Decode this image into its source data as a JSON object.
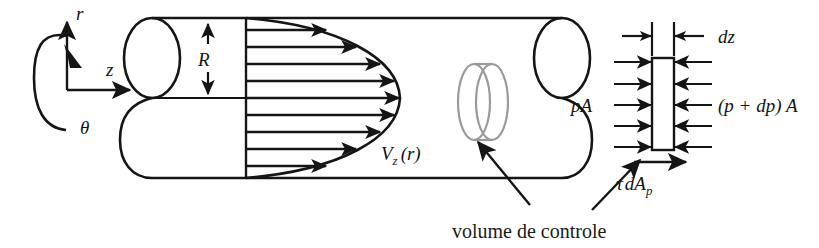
{
  "figure": {
    "background_color": "#ffffff",
    "ink_color": "#151515",
    "control_volume_color": "#9a9a9a",
    "width": 819,
    "height": 248
  },
  "axes": {
    "radial_label": "r",
    "axial_label": "z",
    "angular_label": "θ"
  },
  "pipe": {
    "radius_label": "R",
    "velocity_profile_label": "V",
    "velocity_profile_sub": "z",
    "velocity_profile_arg": "(r)",
    "arrow_count": 9
  },
  "control_volume": {
    "caption": "volume de controle"
  },
  "free_body": {
    "length_label": "dz",
    "upstream_pressure_label": "pA",
    "downstream_pressure_label": "(p + dp) A",
    "shear_label": "τ",
    "shear_label_rest": "dA",
    "shear_label_sub": "p",
    "pressure_arrow_count": 5
  }
}
